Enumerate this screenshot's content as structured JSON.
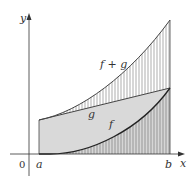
{
  "diagram": {
    "axes": {
      "x_label": "x",
      "y_label": "y",
      "origin_label": "0"
    },
    "interval": {
      "left_label": "a",
      "right_label": "b"
    },
    "curves": [
      {
        "name": "f",
        "label": "f",
        "description": "convex increasing curve from 0 at a"
      },
      {
        "name": "g",
        "label": "g",
        "description": "straight line, positive at a"
      },
      {
        "name": "f_plus_g",
        "label": "f + g",
        "description": "upper convex curve, sum of f and g"
      }
    ],
    "colors": {
      "region_fill": "#d9d9d9",
      "hatch": "#888888",
      "curve": "#333333",
      "axis": "#333333"
    }
  }
}
